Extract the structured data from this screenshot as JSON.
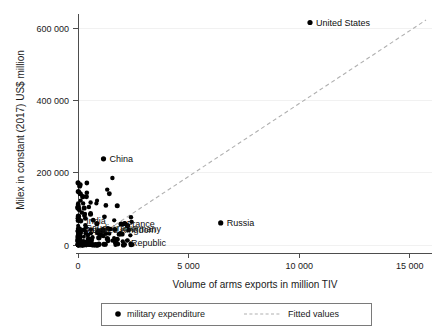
{
  "chart_data": {
    "type": "scatter",
    "title": "",
    "xlabel": "Volume of arms exports in million TIV",
    "ylabel": "Milex in constant (2017) US$ million",
    "xlim": [
      0,
      16000
    ],
    "ylim": [
      0,
      650000
    ],
    "xticks": [
      0,
      5000,
      10000,
      15000
    ],
    "xtick_labels": [
      "0",
      "5 000",
      "10 000",
      "15 000"
    ],
    "yticks": [
      0,
      200000,
      400000,
      600000
    ],
    "ytick_labels": [
      "0",
      "200 000",
      "400 000",
      "600 000"
    ],
    "grid": "horizontal-faint",
    "legend_position": "bottom-outside",
    "legend": [
      {
        "label": "military expenditure",
        "marker": "filled-circle",
        "color": "#000000"
      },
      {
        "label": "Fitted values",
        "marker": "dashed-line",
        "color": "#b0b0b0"
      }
    ],
    "series": [
      {
        "name": "military expenditure",
        "marker": "filled-circle",
        "color": "#000000",
        "labeled_points": [
          {
            "label": "United States",
            "x": 10500,
            "y": 630000
          },
          {
            "label": "China",
            "x": 1150,
            "y": 238000
          },
          {
            "label": "Russia",
            "x": 6450,
            "y": 61000
          },
          {
            "label": "India",
            "x": 120,
            "y": 67000
          },
          {
            "label": "France",
            "x": 1950,
            "y": 58000
          },
          {
            "label": "United Kingdom",
            "x": 1350,
            "y": 46000
          },
          {
            "label": "Germany",
            "x": 1450,
            "y": 44000
          },
          {
            "label": "Japan",
            "x": 60,
            "y": 45000
          },
          {
            "label": "Saudi Arabia",
            "x": 40,
            "y": 70000
          },
          {
            "label": "Republic",
            "x": 1700,
            "y": 5000
          }
        ],
        "cluster_note": "Dense overlapping cluster of ~150 countries near origin with x between 0 and 2500 and y between 0 and 70000"
      },
      {
        "name": "Fitted values",
        "type": "line",
        "style": "dashed",
        "color": "#b0b0b0",
        "endpoints": [
          {
            "x": 0,
            "y": -8000
          },
          {
            "x": 16000,
            "y": 628000
          }
        ]
      }
    ]
  }
}
